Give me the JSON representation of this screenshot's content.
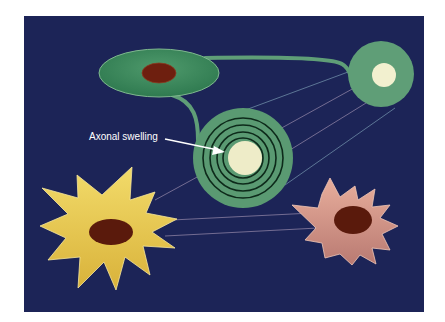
{
  "diagram": {
    "background_color": "#1c2457",
    "annotation": {
      "label": "Axonal swelling",
      "color": "#ffffff"
    },
    "elements": [
      {
        "name": "oligodendrocyte-cell-body",
        "shape": "ellipse",
        "color": "#3f8a5e",
        "nucleus_color": "#6e1f0f"
      },
      {
        "name": "myelinated-axon-upper",
        "shape": "circle",
        "color": "#5f9e77",
        "core_color": "#f2f0cf"
      },
      {
        "name": "axonal-swelling-spiral",
        "shape": "concentric-rings",
        "color": "#5a9a72",
        "ring_color": "#0d2a1a",
        "core_color": "#eeecc8",
        "ring_count": 4
      },
      {
        "name": "yellow-star-cell",
        "shape": "star",
        "color": "#efd357",
        "nucleus_color": "#5a1a0c"
      },
      {
        "name": "pink-star-cell",
        "shape": "star",
        "color": "#d9958a",
        "nucleus_color": "#5a1a0c"
      }
    ],
    "line_colors": [
      "#b9a6c2",
      "#8fb6c8"
    ]
  }
}
